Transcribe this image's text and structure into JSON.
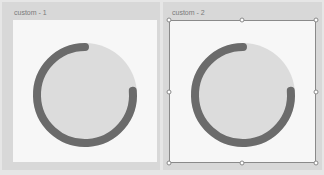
{
  "panels": [
    {
      "label": "custom - 1",
      "selected": false,
      "gauge": {
        "track_color": "#dcdcdc",
        "arc_color": "#6b6b6b",
        "arc_start_deg": 0,
        "arc_sweep_deg": -265
      }
    },
    {
      "label": "custom - 2",
      "selected": true,
      "gauge": {
        "track_color": "#dcdcdc",
        "arc_color": "#6b6b6b",
        "arc_start_deg": 0,
        "arc_sweep_deg": -265
      }
    }
  ],
  "selection": {
    "border_color": "#8a8a8a",
    "handles": [
      "top-left",
      "top-center",
      "top-right",
      "middle-left",
      "middle-right",
      "bottom-left",
      "bottom-center",
      "bottom-right"
    ]
  }
}
